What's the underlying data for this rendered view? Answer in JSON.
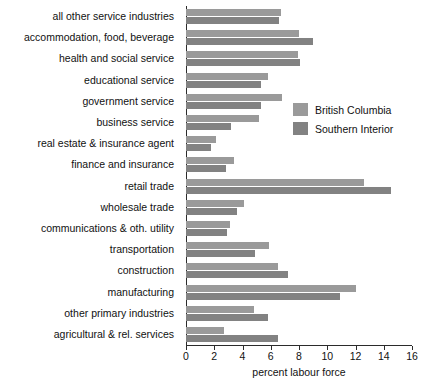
{
  "chart_data": {
    "type": "bar",
    "orientation": "horizontal",
    "title": "",
    "xlabel": "percent labour force",
    "ylabel": "",
    "xlim": [
      0,
      16
    ],
    "xticks": [
      0,
      2,
      4,
      6,
      8,
      10,
      12,
      14,
      16
    ],
    "grid": false,
    "legend_position": "inside-right",
    "categories": [
      "all other service industries",
      "accommodation, food, beverage",
      "health and social service",
      "educational service",
      "government service",
      "business service",
      "real estate & insurance agent",
      "finance and insurance",
      "retail trade",
      "wholesale trade",
      "communications & oth. utility",
      "transportation",
      "construction",
      "manufacturing",
      "other primary industries",
      "agricultural & rel. services"
    ],
    "series": [
      {
        "name": "British Columbia",
        "color": "#9a9a9a",
        "values": [
          6.7,
          8.0,
          7.9,
          5.8,
          6.8,
          5.2,
          2.1,
          3.4,
          12.6,
          4.1,
          3.1,
          5.9,
          6.5,
          12.0,
          4.8,
          2.7
        ]
      },
      {
        "name": "Southern Interior",
        "color": "#828282",
        "values": [
          6.6,
          9.0,
          8.1,
          5.3,
          5.3,
          3.2,
          1.8,
          2.8,
          14.5,
          3.6,
          2.9,
          4.9,
          7.2,
          10.9,
          5.8,
          6.5
        ]
      }
    ]
  },
  "legend": {
    "items": [
      {
        "label": "British Columbia"
      },
      {
        "label": "Southern Interior"
      }
    ]
  }
}
